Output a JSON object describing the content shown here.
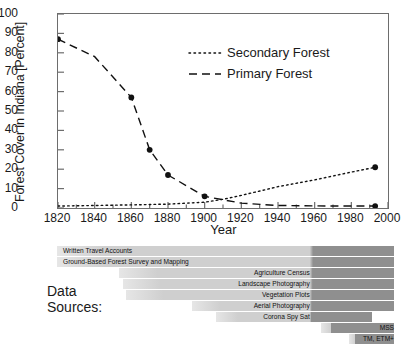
{
  "chart_data": {
    "type": "line",
    "title": "",
    "xlabel": "Year",
    "ylabel": "Forest Cover in Indiana [Percent]",
    "xlim": [
      1820,
      2000
    ],
    "ylim": [
      0,
      100
    ],
    "xticks": [
      1820,
      1840,
      1860,
      1880,
      1900,
      1920,
      1940,
      1960,
      1980,
      2000
    ],
    "yticks": [
      0,
      10,
      20,
      30,
      40,
      50,
      60,
      70,
      80,
      90,
      100
    ],
    "grid": false,
    "legend_position": "upper-center",
    "series": [
      {
        "name": "Secondary Forest",
        "style": "dotted",
        "x": [
          1820,
          1840,
          1860,
          1870,
          1880,
          1900,
          1910,
          1920,
          1940,
          1960,
          1980,
          1993
        ],
        "y": [
          1,
          1.3,
          1.6,
          1.8,
          2,
          3,
          4.5,
          6.5,
          11,
          14.5,
          18.5,
          21
        ],
        "markers": [
          {
            "x": 1993,
            "y": 21
          }
        ]
      },
      {
        "name": "Primary Forest",
        "style": "dashed",
        "x": [
          1820,
          1840,
          1860,
          1870,
          1880,
          1900,
          1920,
          1940,
          1960,
          1980,
          1993
        ],
        "y": [
          87,
          78,
          57,
          30,
          17,
          6,
          2.5,
          1.3,
          1.1,
          1,
          1
        ],
        "markers": [
          {
            "x": 1820,
            "y": 87
          },
          {
            "x": 1860,
            "y": 57
          },
          {
            "x": 1870,
            "y": 30
          },
          {
            "x": 1880,
            "y": 17
          },
          {
            "x": 1900,
            "y": 6
          },
          {
            "x": 1993,
            "y": 1
          }
        ]
      }
    ]
  },
  "legend": {
    "items": [
      {
        "label": "Secondary Forest",
        "style": "dotted"
      },
      {
        "label": "Primary Forest",
        "style": "dashed"
      }
    ]
  },
  "data_sources": {
    "title_line1": "Data",
    "title_line2": "Sources:",
    "rows": [
      {
        "label": "Written Travel Accounts",
        "start_year": 1820,
        "end_year": 2000,
        "align": "left",
        "row": 0
      },
      {
        "label": "Ground-Based Forest Survey and Mapping",
        "start_year": 1820,
        "end_year": 2000,
        "align": "left",
        "row": 1
      },
      {
        "label": "Agriculture Census",
        "start_year": 1853,
        "end_year": 2000,
        "align": "right",
        "row": 2
      },
      {
        "label": "Landscape Photography",
        "start_year": 1855,
        "end_year": 2000,
        "align": "right",
        "row": 3
      },
      {
        "label": "Vegetation Plots",
        "start_year": 1857,
        "end_year": 2000,
        "align": "right",
        "row": 4
      },
      {
        "label": "Aerial Photography",
        "start_year": 1892,
        "end_year": 2000,
        "align": "right",
        "row": 5
      },
      {
        "label": "Corona Spy Sat",
        "start_year": 1905,
        "end_year": 1988,
        "align": "right",
        "row": 6
      },
      {
        "label": "MSS",
        "start_year": 1961,
        "end_year": 2000,
        "align": "right",
        "row": 7
      },
      {
        "label": "TM, ETM+",
        "start_year": 1976,
        "end_year": 2000,
        "align": "right",
        "row": 8
      }
    ]
  },
  "colors": {
    "axis": "#6d6d6d",
    "line": "#111111",
    "bar_light": "#cfcfcf",
    "bar_dark": "#8f8f8f",
    "text": "#1a1a1a"
  }
}
